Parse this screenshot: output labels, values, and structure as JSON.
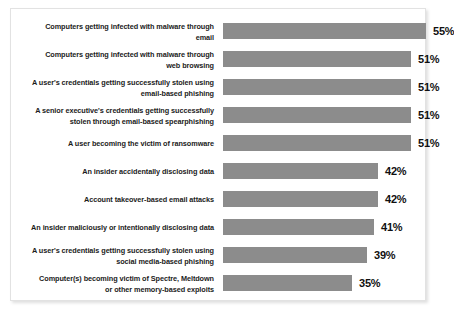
{
  "chart_data": {
    "type": "bar",
    "orientation": "horizontal",
    "title": "",
    "subtitle": "",
    "xlabel": "",
    "ylabel": "",
    "xlim": [
      0,
      55
    ],
    "grid": false,
    "legend": null,
    "value_suffix": "%",
    "categories": [
      "Computers getting infected with malware through email",
      "Computers getting infected with malware through web browsing",
      "A user's credentials getting successfully stolen using email-based phishing",
      "A senior executive's credentials getting successfully stolen through email-based spearphishing",
      "A user becoming the victim of ransomware",
      "An insider accidentally disclosing data",
      "Account takeover-based email attacks",
      "An insider maliciously or intentionally disclosing data",
      "A user's credentials getting successfully stolen using social media-based phishing",
      "Computer(s) becoming victim of Spectre, Meltdown or other memory-based exploits"
    ],
    "values": [
      55,
      51,
      51,
      51,
      51,
      42,
      42,
      41,
      39,
      35
    ],
    "value_labels": [
      "55%",
      "51%",
      "51%",
      "51%",
      "51%",
      "42%",
      "42%",
      "41%",
      "39%",
      "35%"
    ],
    "bar_color": "#8c8c8c"
  },
  "rows": [
    {
      "label_line1": "Computers getting infected with malware through",
      "label_line2": "email",
      "value": 55,
      "value_label": "55%"
    },
    {
      "label_line1": "Computers getting infected with malware through",
      "label_line2": "web browsing",
      "value": 51,
      "value_label": "51%"
    },
    {
      "label_line1": "A user's credentials getting successfully stolen using",
      "label_line2": "email-based phishing",
      "value": 51,
      "value_label": "51%"
    },
    {
      "label_line1": "A senior executive's credentials getting successfully",
      "label_line2": "stolen through email-based spearphishing",
      "value": 51,
      "value_label": "51%"
    },
    {
      "label_line1": "A user becoming the victim of ransomware",
      "label_line2": "",
      "value": 51,
      "value_label": "51%"
    },
    {
      "label_line1": "An insider accidentally disclosing data",
      "label_line2": "",
      "value": 42,
      "value_label": "42%"
    },
    {
      "label_line1": "Account takeover-based email attacks",
      "label_line2": "",
      "value": 42,
      "value_label": "42%"
    },
    {
      "label_line1": "An insider maliciously or intentionally disclosing data",
      "label_line2": "",
      "value": 41,
      "value_label": "41%"
    },
    {
      "label_line1": "A user's credentials getting successfully stolen using",
      "label_line2": "social media-based phishing",
      "value": 39,
      "value_label": "39%"
    },
    {
      "label_line1": "Computer(s) becoming victim of Spectre, Meltdown",
      "label_line2": "or other memory-based exploits",
      "value": 35,
      "value_label": "35%"
    }
  ]
}
